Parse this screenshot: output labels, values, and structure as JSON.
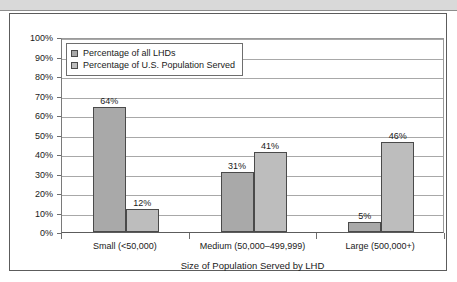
{
  "caption": {
    "text": ""
  },
  "chart_data": {
    "type": "bar",
    "title": "",
    "xlabel": "Size of Population Served by LHD",
    "ylabel": "",
    "categories": [
      "Small (<50,000)",
      "Medium (50,000–499,999)",
      "Large (500,000+)"
    ],
    "series": [
      {
        "name": "Percentage of all LHDs",
        "color": "#a9a9a9",
        "values": [
          64,
          31,
          5
        ],
        "labels": [
          "64%",
          "31%",
          "5%"
        ]
      },
      {
        "name": "Percentage of U.S. Population Served",
        "color": "#bdbdbd",
        "values": [
          12,
          41,
          46
        ],
        "labels": [
          "12%",
          "41%",
          "46%"
        ]
      }
    ],
    "ylim": [
      0,
      100
    ],
    "ytick_values": [
      0,
      10,
      20,
      30,
      40,
      50,
      60,
      70,
      80,
      90,
      100
    ],
    "ytick_labels": [
      "0%",
      "10%",
      "20%",
      "30%",
      "40%",
      "50%",
      "60%",
      "70%",
      "80%",
      "90%",
      "100%"
    ],
    "grid": true,
    "legend_position": "top-left",
    "bar_outline_color": "#4a4a4a",
    "gridline_color": "#a8a8a8"
  }
}
